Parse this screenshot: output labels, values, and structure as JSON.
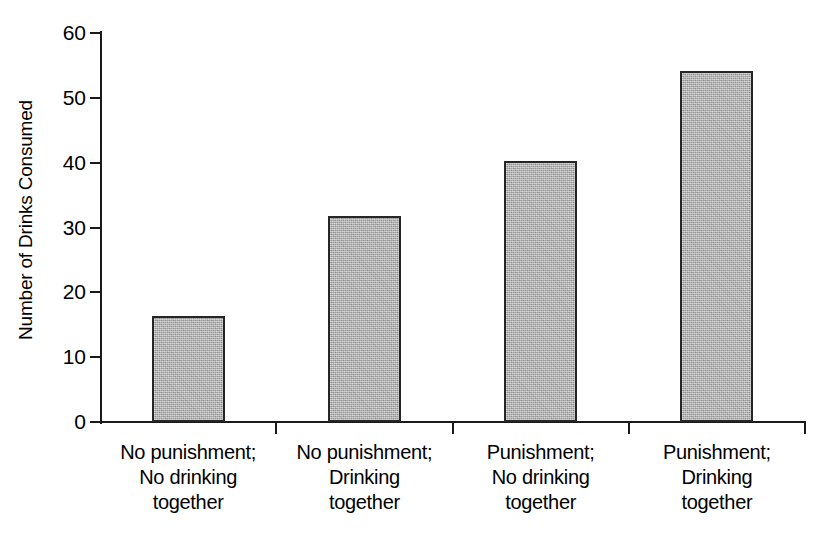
{
  "chart_data": {
    "type": "bar",
    "title": "",
    "xlabel": "",
    "ylabel": "Number of Drinks Consumed",
    "ylim": [
      0,
      60
    ],
    "ytick_values": [
      60,
      50,
      40,
      30,
      20,
      10,
      0
    ],
    "ytick_labels": [
      "60",
      "50",
      "40",
      "30",
      "20",
      "10",
      "0"
    ],
    "grid": false,
    "legend": null,
    "categories": [
      "No punishment; No drinking together",
      "No punishment; Drinking together",
      "Punishment; No drinking together",
      "Punishment; Drinking together"
    ],
    "category_label_lines": [
      [
        "No punishment;",
        "No drinking",
        "together"
      ],
      [
        "No punishment;",
        "Drinking",
        "together"
      ],
      [
        "Punishment;",
        "No drinking",
        "together"
      ],
      [
        "Punishment;",
        "Drinking",
        "together"
      ]
    ],
    "values": [
      16.4,
      31.7,
      40.3,
      54.2
    ],
    "bar_color": "#b4b4b4",
    "bar_edge_color": "#262626",
    "axis_color": "#1a1a1a",
    "background_color": "#ffffff"
  }
}
